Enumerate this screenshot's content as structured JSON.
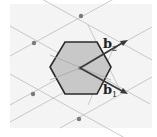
{
  "diagram": {
    "colors": {
      "background_panel": "#f4f4f4",
      "lattice_line": "#bdbdbd",
      "lattice_point": "#7a7a7a",
      "hexagon_fill": "#c8c8c8",
      "hexagon_stroke": "#2a2a2a",
      "vector": "#3a3a3a"
    },
    "center": [
      80,
      68
    ],
    "lattice_points": [
      [
        81,
        16
      ],
      [
        34,
        43
      ],
      [
        127,
        41
      ],
      [
        127,
        93
      ],
      [
        33,
        94
      ],
      [
        79,
        119
      ]
    ],
    "hexagon": [
      [
        65,
        42
      ],
      [
        97,
        42
      ],
      [
        111,
        67
      ],
      [
        97,
        94
      ],
      [
        65,
        94
      ],
      [
        50,
        67
      ]
    ],
    "vectors": [
      {
        "name": "b1",
        "label": "b",
        "subscript": "1",
        "to": [
          127,
          93
        ],
        "label_pos": [
          104,
          94
        ]
      },
      {
        "name": "b2",
        "label": "b",
        "subscript": "2",
        "to": [
          127,
          41
        ],
        "label_pos": [
          104,
          48
        ]
      }
    ]
  }
}
